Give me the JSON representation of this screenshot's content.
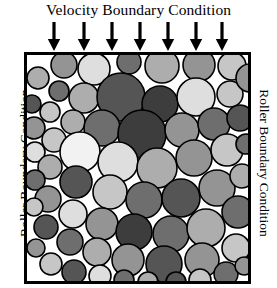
{
  "figure": {
    "top_label": "Velocity Boundary Condition",
    "left_label": "Roller Boundary Condition",
    "right_label": "Roller Boundary Condition",
    "stroke_color": "#000000",
    "background_color": "#ffffff",
    "arrow_icon_name": "down-arrow-icon",
    "arrow_count": 7,
    "arrows_x": [
      54,
      84,
      112,
      140,
      168,
      196,
      222
    ]
  },
  "chart_data": {
    "type": "scatter",
    "title": "Velocity Boundary Condition",
    "xlabel": "",
    "ylabel": "",
    "grid": false,
    "legend": null,
    "annotations": [
      "Velocity Boundary Condition",
      "Roller Boundary Condition",
      "Roller Boundary Condition"
    ],
    "domain": {
      "x": [
        24,
        251
      ],
      "y": [
        52,
        284
      ],
      "width": 227,
      "height": 232,
      "border_width": 3
    },
    "fill_palette": {
      "white": "#fdfdfd",
      "near_white": "#f2f2f2",
      "light": "#dedede",
      "light_mid": "#c6c6c6",
      "mid": "#adadad",
      "mid_dark": "#949494",
      "dark": "#6e6e6e",
      "darker": "#555555",
      "darkest": "#3d3d3d"
    },
    "particles": [
      {
        "cx": 40,
        "cy": 13,
        "r": 13,
        "fill": "#949494"
      },
      {
        "cx": 70,
        "cy": 17,
        "r": 16,
        "fill": "#dedede"
      },
      {
        "cx": 105,
        "cy": 10,
        "r": 12,
        "fill": "#6e6e6e"
      },
      {
        "cx": 138,
        "cy": 14,
        "r": 17,
        "fill": "#adadad"
      },
      {
        "cx": 175,
        "cy": 13,
        "r": 16,
        "fill": "#949494"
      },
      {
        "cx": 208,
        "cy": 14,
        "r": 14,
        "fill": "#c6c6c6"
      },
      {
        "cx": 14,
        "cy": 26,
        "r": 11,
        "fill": "#adadad"
      },
      {
        "cx": 35,
        "cy": 39,
        "r": 10,
        "fill": "#6e6e6e"
      },
      {
        "cx": 60,
        "cy": 46,
        "r": 15,
        "fill": "#adadad"
      },
      {
        "cx": 97,
        "cy": 45,
        "r": 24,
        "fill": "#555555"
      },
      {
        "cx": 136,
        "cy": 52,
        "r": 18,
        "fill": "#3d3d3d"
      },
      {
        "cx": 172,
        "cy": 45,
        "r": 19,
        "fill": "#dedede"
      },
      {
        "cx": 206,
        "cy": 42,
        "r": 13,
        "fill": "#c6c6c6"
      },
      {
        "cx": 226,
        "cy": 26,
        "r": 14,
        "fill": "#949494"
      },
      {
        "cx": 8,
        "cy": 52,
        "r": 9,
        "fill": "#555555"
      },
      {
        "cx": 26,
        "cy": 60,
        "r": 10,
        "fill": "#c6c6c6"
      },
      {
        "cx": 49,
        "cy": 70,
        "r": 12,
        "fill": "#adadad"
      },
      {
        "cx": 78,
        "cy": 76,
        "r": 18,
        "fill": "#6e6e6e"
      },
      {
        "cx": 118,
        "cy": 82,
        "r": 24,
        "fill": "#3d3d3d"
      },
      {
        "cx": 158,
        "cy": 78,
        "r": 17,
        "fill": "#949494"
      },
      {
        "cx": 190,
        "cy": 72,
        "r": 16,
        "fill": "#6e6e6e"
      },
      {
        "cx": 216,
        "cy": 66,
        "r": 13,
        "fill": "#555555"
      },
      {
        "cx": 10,
        "cy": 76,
        "r": 11,
        "fill": "#949494"
      },
      {
        "cx": 30,
        "cy": 88,
        "r": 12,
        "fill": "#c6c6c6"
      },
      {
        "cx": 56,
        "cy": 100,
        "r": 20,
        "fill": "#f2f2f2"
      },
      {
        "cx": 94,
        "cy": 110,
        "r": 20,
        "fill": "#dedede"
      },
      {
        "cx": 133,
        "cy": 116,
        "r": 20,
        "fill": "#adadad"
      },
      {
        "cx": 170,
        "cy": 106,
        "r": 18,
        "fill": "#949494"
      },
      {
        "cx": 203,
        "cy": 98,
        "r": 16,
        "fill": "#c6c6c6"
      },
      {
        "cx": 222,
        "cy": 92,
        "r": 10,
        "fill": "#6e6e6e"
      },
      {
        "cx": 11,
        "cy": 100,
        "r": 10,
        "fill": "#dedede"
      },
      {
        "cx": 26,
        "cy": 115,
        "r": 12,
        "fill": "#adadad"
      },
      {
        "cx": 52,
        "cy": 130,
        "r": 16,
        "fill": "#555555"
      },
      {
        "cx": 86,
        "cy": 140,
        "r": 17,
        "fill": "#c6c6c6"
      },
      {
        "cx": 120,
        "cy": 148,
        "r": 18,
        "fill": "#6e6e6e"
      },
      {
        "cx": 157,
        "cy": 146,
        "r": 19,
        "fill": "#555555"
      },
      {
        "cx": 193,
        "cy": 136,
        "r": 18,
        "fill": "#949494"
      },
      {
        "cx": 218,
        "cy": 124,
        "r": 12,
        "fill": "#adadad"
      },
      {
        "cx": 11,
        "cy": 128,
        "r": 10,
        "fill": "#6e6e6e"
      },
      {
        "cx": 24,
        "cy": 147,
        "r": 13,
        "fill": "#949494"
      },
      {
        "cx": 49,
        "cy": 162,
        "r": 14,
        "fill": "#dedede"
      },
      {
        "cx": 78,
        "cy": 172,
        "r": 16,
        "fill": "#949494"
      },
      {
        "cx": 110,
        "cy": 180,
        "r": 18,
        "fill": "#3d3d3d"
      },
      {
        "cx": 147,
        "cy": 182,
        "r": 18,
        "fill": "#6e6e6e"
      },
      {
        "cx": 182,
        "cy": 176,
        "r": 19,
        "fill": "#adadad"
      },
      {
        "cx": 214,
        "cy": 160,
        "r": 16,
        "fill": "#6e6e6e"
      },
      {
        "cx": 10,
        "cy": 155,
        "r": 9,
        "fill": "#c6c6c6"
      },
      {
        "cx": 22,
        "cy": 175,
        "r": 12,
        "fill": "#555555"
      },
      {
        "cx": 46,
        "cy": 190,
        "r": 13,
        "fill": "#6e6e6e"
      },
      {
        "cx": 73,
        "cy": 200,
        "r": 14,
        "fill": "#adadad"
      },
      {
        "cx": 104,
        "cy": 208,
        "r": 16,
        "fill": "#949494"
      },
      {
        "cx": 140,
        "cy": 212,
        "r": 18,
        "fill": "#555555"
      },
      {
        "cx": 178,
        "cy": 208,
        "r": 17,
        "fill": "#949494"
      },
      {
        "cx": 212,
        "cy": 196,
        "r": 14,
        "fill": "#c6c6c6"
      },
      {
        "cx": 12,
        "cy": 196,
        "r": 9,
        "fill": "#949494"
      },
      {
        "cx": 27,
        "cy": 212,
        "r": 11,
        "fill": "#c6c6c6"
      },
      {
        "cx": 50,
        "cy": 220,
        "r": 12,
        "fill": "#555555"
      },
      {
        "cx": 76,
        "cy": 224,
        "r": 11,
        "fill": "#dedede"
      },
      {
        "cx": 100,
        "cy": 228,
        "r": 10,
        "fill": "#6e6e6e"
      },
      {
        "cx": 124,
        "cy": 230,
        "r": 10,
        "fill": "#adadad"
      },
      {
        "cx": 152,
        "cy": 230,
        "r": 10,
        "fill": "#555555"
      },
      {
        "cx": 176,
        "cy": 228,
        "r": 11,
        "fill": "#c6c6c6"
      },
      {
        "cx": 202,
        "cy": 222,
        "r": 12,
        "fill": "#6e6e6e"
      },
      {
        "cx": 220,
        "cy": 214,
        "r": 9,
        "fill": "#949494"
      }
    ]
  }
}
